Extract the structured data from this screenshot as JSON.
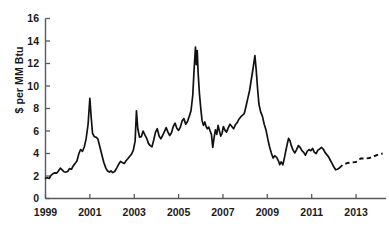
{
  "chart_data": {
    "type": "line",
    "title": "",
    "subtitle": "",
    "xlabel": "",
    "ylabel": "$ per MM Btu",
    "xlim": [
      1999.0,
      2014.35
    ],
    "ylim": [
      0,
      16
    ],
    "grid": false,
    "legend": null,
    "y_ticks": [
      0,
      2,
      4,
      6,
      8,
      10,
      12,
      14,
      16
    ],
    "y_tick_labels": [
      "0",
      "2",
      "4",
      "6",
      "8",
      "10",
      "12",
      "14",
      "16"
    ],
    "x_ticks": [
      1999,
      2001,
      2003,
      2005,
      2007,
      2009,
      2011,
      2013
    ],
    "x_tick_labels": [
      "1999",
      "2001",
      "2003",
      "2005",
      "2007",
      "2009",
      "2011",
      "2013"
    ],
    "series": [
      {
        "name": "Natural gas price (historical)",
        "style": "solid",
        "color": "#111111",
        "points": [
          [
            1999.0,
            1.8
          ],
          [
            1999.08,
            1.85
          ],
          [
            1999.17,
            1.78
          ],
          [
            1999.25,
            2.05
          ],
          [
            1999.33,
            2.2
          ],
          [
            1999.42,
            2.28
          ],
          [
            1999.5,
            2.25
          ],
          [
            1999.58,
            2.45
          ],
          [
            1999.67,
            2.7
          ],
          [
            1999.75,
            2.55
          ],
          [
            1999.83,
            2.38
          ],
          [
            1999.92,
            2.35
          ],
          [
            2000.0,
            2.4
          ],
          [
            2000.08,
            2.65
          ],
          [
            2000.17,
            2.6
          ],
          [
            2000.25,
            2.9
          ],
          [
            2000.33,
            3.1
          ],
          [
            2000.42,
            3.35
          ],
          [
            2000.5,
            3.95
          ],
          [
            2000.58,
            4.35
          ],
          [
            2000.67,
            4.2
          ],
          [
            2000.75,
            4.6
          ],
          [
            2000.83,
            5.3
          ],
          [
            2000.92,
            6.6
          ],
          [
            2001.0,
            8.9
          ],
          [
            2001.06,
            7.2
          ],
          [
            2001.12,
            5.8
          ],
          [
            2001.2,
            5.5
          ],
          [
            2001.28,
            5.45
          ],
          [
            2001.36,
            5.3
          ],
          [
            2001.45,
            4.6
          ],
          [
            2001.55,
            3.8
          ],
          [
            2001.63,
            3.2
          ],
          [
            2001.72,
            2.7
          ],
          [
            2001.8,
            2.45
          ],
          [
            2001.88,
            2.35
          ],
          [
            2001.95,
            2.45
          ],
          [
            2002.03,
            2.3
          ],
          [
            2002.12,
            2.4
          ],
          [
            2002.22,
            2.75
          ],
          [
            2002.3,
            3.05
          ],
          [
            2002.38,
            3.3
          ],
          [
            2002.46,
            3.2
          ],
          [
            2002.55,
            3.1
          ],
          [
            2002.63,
            3.35
          ],
          [
            2002.72,
            3.55
          ],
          [
            2002.8,
            3.75
          ],
          [
            2002.88,
            3.95
          ],
          [
            2002.96,
            4.3
          ],
          [
            2003.04,
            5.1
          ],
          [
            2003.1,
            7.8
          ],
          [
            2003.16,
            6.2
          ],
          [
            2003.24,
            5.45
          ],
          [
            2003.32,
            5.5
          ],
          [
            2003.4,
            6.0
          ],
          [
            2003.48,
            5.65
          ],
          [
            2003.56,
            5.35
          ],
          [
            2003.64,
            4.9
          ],
          [
            2003.72,
            4.7
          ],
          [
            2003.8,
            4.6
          ],
          [
            2003.88,
            5.2
          ],
          [
            2003.96,
            5.9
          ],
          [
            2004.04,
            6.2
          ],
          [
            2004.12,
            5.55
          ],
          [
            2004.2,
            5.3
          ],
          [
            2004.28,
            5.6
          ],
          [
            2004.36,
            5.95
          ],
          [
            2004.44,
            6.3
          ],
          [
            2004.52,
            5.9
          ],
          [
            2004.6,
            5.6
          ],
          [
            2004.68,
            5.85
          ],
          [
            2004.76,
            6.4
          ],
          [
            2004.84,
            6.7
          ],
          [
            2004.92,
            6.25
          ],
          [
            2005.0,
            6.05
          ],
          [
            2005.08,
            6.35
          ],
          [
            2005.16,
            6.9
          ],
          [
            2005.24,
            7.1
          ],
          [
            2005.32,
            6.6
          ],
          [
            2005.4,
            6.85
          ],
          [
            2005.48,
            7.3
          ],
          [
            2005.56,
            7.8
          ],
          [
            2005.64,
            9.2
          ],
          [
            2005.7,
            11.5
          ],
          [
            2005.76,
            13.45
          ],
          [
            2005.8,
            11.9
          ],
          [
            2005.84,
            13.15
          ],
          [
            2005.88,
            11.2
          ],
          [
            2005.94,
            9.3
          ],
          [
            2006.0,
            8.0
          ],
          [
            2006.06,
            6.9
          ],
          [
            2006.12,
            6.5
          ],
          [
            2006.18,
            6.8
          ],
          [
            2006.24,
            6.4
          ],
          [
            2006.3,
            6.2
          ],
          [
            2006.36,
            6.35
          ],
          [
            2006.42,
            6.0
          ],
          [
            2006.48,
            5.7
          ],
          [
            2006.54,
            4.55
          ],
          [
            2006.6,
            5.4
          ],
          [
            2006.66,
            6.1
          ],
          [
            2006.72,
            5.7
          ],
          [
            2006.78,
            6.5
          ],
          [
            2006.84,
            6.0
          ],
          [
            2006.9,
            5.55
          ],
          [
            2006.96,
            5.8
          ],
          [
            2007.02,
            6.4
          ],
          [
            2007.08,
            6.1
          ],
          [
            2007.16,
            5.9
          ],
          [
            2007.24,
            6.3
          ],
          [
            2007.32,
            6.6
          ],
          [
            2007.4,
            6.4
          ],
          [
            2007.48,
            6.2
          ],
          [
            2007.56,
            6.55
          ],
          [
            2007.64,
            6.75
          ],
          [
            2007.72,
            7.05
          ],
          [
            2007.8,
            7.25
          ],
          [
            2007.88,
            7.4
          ],
          [
            2007.96,
            7.55
          ],
          [
            2008.04,
            8.2
          ],
          [
            2008.12,
            8.9
          ],
          [
            2008.2,
            9.6
          ],
          [
            2008.28,
            10.6
          ],
          [
            2008.36,
            11.6
          ],
          [
            2008.44,
            12.7
          ],
          [
            2008.5,
            11.4
          ],
          [
            2008.56,
            9.8
          ],
          [
            2008.62,
            8.4
          ],
          [
            2008.7,
            7.7
          ],
          [
            2008.78,
            7.3
          ],
          [
            2008.86,
            6.6
          ],
          [
            2008.94,
            6.1
          ],
          [
            2009.02,
            5.3
          ],
          [
            2009.1,
            4.6
          ],
          [
            2009.18,
            4.05
          ],
          [
            2009.26,
            3.6
          ],
          [
            2009.34,
            3.8
          ],
          [
            2009.42,
            3.65
          ],
          [
            2009.5,
            3.35
          ],
          [
            2009.56,
            3.0
          ],
          [
            2009.62,
            3.25
          ],
          [
            2009.7,
            3.0
          ],
          [
            2009.78,
            3.7
          ],
          [
            2009.84,
            4.3
          ],
          [
            2009.9,
            4.85
          ],
          [
            2009.96,
            5.35
          ],
          [
            2010.02,
            5.15
          ],
          [
            2010.08,
            4.7
          ],
          [
            2010.16,
            4.3
          ],
          [
            2010.24,
            4.05
          ],
          [
            2010.32,
            4.35
          ],
          [
            2010.4,
            4.7
          ],
          [
            2010.48,
            4.55
          ],
          [
            2010.56,
            4.25
          ],
          [
            2010.64,
            4.1
          ],
          [
            2010.72,
            3.85
          ],
          [
            2010.8,
            4.2
          ],
          [
            2010.88,
            4.35
          ],
          [
            2010.96,
            4.25
          ],
          [
            2011.04,
            4.45
          ],
          [
            2011.12,
            4.1
          ],
          [
            2011.2,
            4.0
          ],
          [
            2011.28,
            4.3
          ],
          [
            2011.36,
            4.4
          ],
          [
            2011.44,
            4.55
          ],
          [
            2011.52,
            4.4
          ],
          [
            2011.6,
            4.1
          ],
          [
            2011.68,
            3.9
          ],
          [
            2011.76,
            3.7
          ],
          [
            2011.84,
            3.4
          ],
          [
            2011.92,
            3.1
          ],
          [
            2012.0,
            2.8
          ],
          [
            2012.08,
            2.55
          ],
          [
            2012.16,
            2.6
          ],
          [
            2012.24,
            2.7
          ]
        ]
      },
      {
        "name": "Natural gas price (forecast)",
        "style": "dashed",
        "color": "#111111",
        "points": [
          [
            2012.24,
            2.7
          ],
          [
            2012.4,
            3.0
          ],
          [
            2012.6,
            3.15
          ],
          [
            2012.8,
            3.2
          ],
          [
            2013.0,
            3.25
          ],
          [
            2013.2,
            3.55
          ],
          [
            2013.4,
            3.55
          ],
          [
            2013.6,
            3.6
          ],
          [
            2013.8,
            3.75
          ],
          [
            2014.0,
            3.9
          ],
          [
            2014.2,
            4.0
          ]
        ]
      }
    ],
    "annotations": []
  }
}
